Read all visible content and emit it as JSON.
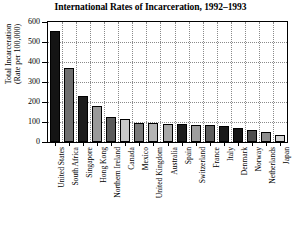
{
  "chart_data": {
    "type": "bar",
    "title": "International Rates of Incarceration, 1992–1993",
    "xlabel": "",
    "ylabel": "Total Incarceration (Rate per 100,000)",
    "ylabel_lines": [
      "Total Incarceration",
      "(Rate per 100,000)"
    ],
    "ylim": [
      0,
      600
    ],
    "yticks": [
      0,
      100,
      200,
      300,
      400,
      500,
      600
    ],
    "ytick_labels": [
      "0",
      "100",
      "200",
      "300",
      "400",
      "500",
      "600"
    ],
    "grid": true,
    "legend": "none",
    "categories": [
      "United States",
      "South Africa",
      "Singapore",
      "Hong Kong",
      "Northern Ireland",
      "Canada",
      "Mexico",
      "United Kingdom",
      "Australia",
      "Spain",
      "Switzerland",
      "France",
      "Italy",
      "Denmark",
      "Norway",
      "Netherlands",
      "Japan"
    ],
    "values": [
      555,
      368,
      229,
      179,
      126,
      116,
      97,
      93,
      91,
      90,
      85,
      84,
      80,
      71,
      62,
      49,
      36
    ],
    "bar_colors": [
      "#141414",
      "#6e6e6e",
      "#1c1c1c",
      "#9a9a9a",
      "#5a5a5a",
      "#c8c8c8",
      "#7a7a7a",
      "#b4b4b4",
      "#a8a8a8",
      "#1e1e1e",
      "#9e9e9e",
      "#5e5e5e",
      "#1a1a1a",
      "#141414",
      "#4e4e4e",
      "#8e8e8e",
      "#d2d2d2"
    ],
    "axis_color": "#000000",
    "grid_color": "#8a8a8a",
    "background": "#ffffff"
  }
}
